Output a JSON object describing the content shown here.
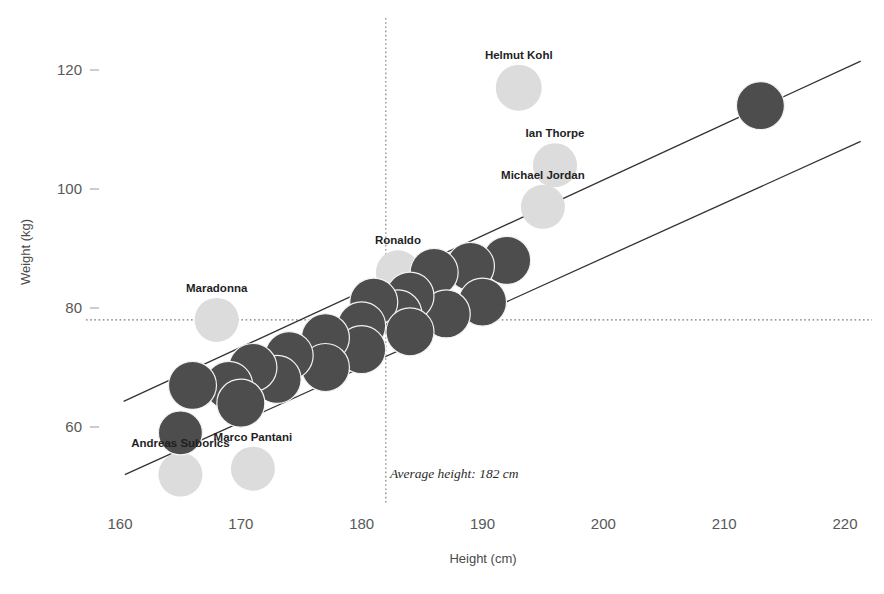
{
  "chart_data": {
    "type": "scatter",
    "title": "",
    "xlabel": "Height (cm)",
    "ylabel": "Weight (kg)",
    "xlim": [
      155,
      223
    ],
    "ylim": [
      45,
      127
    ],
    "xticks": [
      160,
      170,
      180,
      190,
      200,
      210,
      220
    ],
    "xtick_labels": [
      "160",
      "170",
      "180",
      "190",
      "200",
      "210",
      "220"
    ],
    "yticks": [
      60,
      80,
      100,
      120
    ],
    "ytick_labels": [
      "60",
      "80",
      "100",
      "120"
    ],
    "grid": false,
    "legend": "none",
    "colors": {
      "dark_point": "#4d4d4d",
      "light_point": "#dcdcdc",
      "point_stroke": "#f2f2f2",
      "trend_line": "#333333",
      "reference_line": "#777777",
      "text": "#3c3c3c",
      "background": "#ffffff"
    },
    "reference_lines": [
      {
        "name": "average-height-line",
        "orientation": "vertical",
        "value": 182,
        "style": "dotted",
        "label": "Average height: 182 cm"
      },
      {
        "name": "average-weight-line",
        "orientation": "horizontal",
        "value": 78,
        "style": "dotted",
        "label": ""
      }
    ],
    "trend_lines": [
      {
        "name": "upper-bound-line",
        "x1": 160.3,
        "y1": 64.3,
        "x2": 221.3,
        "y2": 121.5
      },
      {
        "name": "lower-bound-line",
        "x1": 160.4,
        "y1": 52.0,
        "x2": 221.3,
        "y2": 108.0
      }
    ],
    "labeled_points": [
      {
        "label": "Helmut Kohl",
        "x": 193,
        "y": 117,
        "series": "light",
        "r": 23
      },
      {
        "label": "Ian Thorpe",
        "x": 196,
        "y": 104,
        "series": "light",
        "r": 22
      },
      {
        "label": "Michael Jordan",
        "x": 195,
        "y": 97,
        "series": "light",
        "r": 22
      },
      {
        "label": "Ronaldo",
        "x": 183,
        "y": 86,
        "series": "light",
        "r": 22
      },
      {
        "label": "Maradonna",
        "x": 168,
        "y": 78,
        "series": "light",
        "r": 22
      },
      {
        "label": "Andreas Suborics",
        "x": 165,
        "y": 52,
        "series": "light",
        "r": 22
      },
      {
        "label": "Marco Pantani",
        "x": 171,
        "y": 53,
        "series": "light",
        "r": 22
      }
    ],
    "points": [
      {
        "x": 213,
        "y": 114,
        "series": "dark",
        "r": 24
      },
      {
        "x": 192,
        "y": 88,
        "series": "dark",
        "r": 24
      },
      {
        "x": 189,
        "y": 87,
        "series": "dark",
        "r": 24
      },
      {
        "x": 186,
        "y": 86,
        "series": "dark",
        "r": 24
      },
      {
        "x": 190,
        "y": 81,
        "series": "dark",
        "r": 24
      },
      {
        "x": 187,
        "y": 79,
        "series": "dark",
        "r": 24
      },
      {
        "x": 184,
        "y": 82,
        "series": "dark",
        "r": 24
      },
      {
        "x": 183,
        "y": 79,
        "series": "dark",
        "r": 24
      },
      {
        "x": 181,
        "y": 81,
        "series": "dark",
        "r": 24
      },
      {
        "x": 184,
        "y": 76,
        "series": "dark",
        "r": 24
      },
      {
        "x": 180,
        "y": 77,
        "series": "dark",
        "r": 24
      },
      {
        "x": 180,
        "y": 73,
        "series": "dark",
        "r": 24
      },
      {
        "x": 177,
        "y": 75,
        "series": "dark",
        "r": 24
      },
      {
        "x": 177,
        "y": 70,
        "series": "dark",
        "r": 24
      },
      {
        "x": 174,
        "y": 72,
        "series": "dark",
        "r": 24
      },
      {
        "x": 173,
        "y": 68,
        "series": "dark",
        "r": 24
      },
      {
        "x": 171,
        "y": 70,
        "series": "dark",
        "r": 24
      },
      {
        "x": 169,
        "y": 67,
        "series": "dark",
        "r": 24
      },
      {
        "x": 170,
        "y": 64,
        "series": "dark",
        "r": 24
      },
      {
        "x": 166,
        "y": 67,
        "series": "dark",
        "r": 24
      },
      {
        "x": 165,
        "y": 59,
        "series": "dark",
        "r": 22
      }
    ]
  },
  "annotations": {
    "average_height": "Average height: 182 cm"
  },
  "axes": {
    "x_title": "Height (cm)",
    "y_title": "Weight (kg)"
  }
}
